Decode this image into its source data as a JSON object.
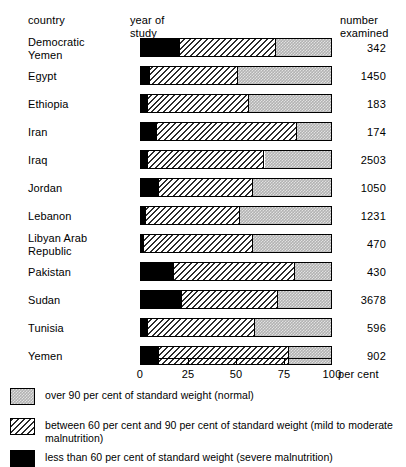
{
  "header": {
    "country_label": "country",
    "year_label": "year of\nstudy",
    "number_label": "number\nexamined"
  },
  "chart_data": {
    "type": "bar",
    "subtype": "stacked-horizontal-100",
    "title": "",
    "xlabel": "per cent",
    "ylabel": "country",
    "xlim": [
      0,
      100
    ],
    "xticks": [
      0,
      25,
      50,
      75,
      100
    ],
    "xtick_labels": [
      "0",
      "25",
      "50",
      "75",
      "100"
    ],
    "axis_unit": "per cent",
    "grid": false,
    "legend_position": "bottom-left",
    "categories": [
      "Democratic Yemen",
      "Egypt",
      "Ethiopia",
      "Iran",
      "Iraq",
      "Jordan",
      "Lebanon",
      "Libyan Arab Republic",
      "Pakistan",
      "Sudan",
      "Tunisia",
      "Yemen"
    ],
    "series": [
      {
        "name": "less than 60 per cent of standard weight (severe malnutrition)",
        "key": "severe",
        "values": [
          20,
          4,
          3,
          8,
          3,
          9,
          2,
          1,
          17,
          21,
          3,
          9
        ]
      },
      {
        "name": "between 60 per cent and 90 per cent of standard weight (mild to moderate malnutrition)",
        "key": "mild",
        "values": [
          51,
          47,
          54,
          74,
          62,
          50,
          50,
          58,
          64,
          51,
          57,
          69
        ]
      },
      {
        "name": "over 90 per cent of standard weight (normal)",
        "key": "normal",
        "values": [
          29,
          49,
          43,
          18,
          35,
          41,
          48,
          41,
          19,
          28,
          40,
          22
        ]
      }
    ],
    "rows": [
      {
        "country": "Democratic\nYemen",
        "year": "1971",
        "number": "342",
        "severe": 20,
        "mild": 51,
        "normal": 29
      },
      {
        "country": "Egypt",
        "year": "1965–66",
        "number": "1450",
        "severe": 4,
        "mild": 47,
        "normal": 49
      },
      {
        "country": "Ethiopia",
        "year": "1970",
        "number": "183",
        "severe": 3,
        "mild": 54,
        "normal": 43
      },
      {
        "country": "Iran",
        "year": "1965–66",
        "number": "174",
        "severe": 8,
        "mild": 74,
        "normal": 18
      },
      {
        "country": "Iraq",
        "year": "1965",
        "number": "2503",
        "severe": 3,
        "mild": 62,
        "normal": 35
      },
      {
        "country": "Jordan",
        "year": "1963–65",
        "number": "1050",
        "severe": 9,
        "mild": 50,
        "normal": 41
      },
      {
        "country": "Lebanon",
        "year": "1969",
        "number": "1231",
        "severe": 2,
        "mild": 50,
        "normal": 48
      },
      {
        "country": "Libyan Arab\nRepublic",
        "year": "1971",
        "number": "470",
        "severe": 1,
        "mild": 58,
        "normal": 41
      },
      {
        "country": "Pakistan",
        "year": "1965–66",
        "number": "430",
        "severe": 17,
        "mild": 64,
        "normal": 19
      },
      {
        "country": "Sudan",
        "year": "1971–72",
        "number": "3678",
        "severe": 21,
        "mild": 51,
        "normal": 28
      },
      {
        "country": "Tunisia",
        "year": "1969–70",
        "number": "596",
        "severe": 3,
        "mild": 57,
        "normal": 40
      },
      {
        "country": "Yemen",
        "year": "1972",
        "number": "902",
        "severe": 9,
        "mild": 69,
        "normal": 22
      }
    ]
  },
  "legend": {
    "items": [
      {
        "swatch": "normal",
        "text": "over 90 per cent of standard weight (normal)"
      },
      {
        "swatch": "mild",
        "text": "between 60 per cent and 90 per cent of standard weight (mild to moderate malnutrition)"
      },
      {
        "swatch": "severe",
        "text": "less than 60 per cent of standard weight (severe malnutrition)"
      }
    ]
  },
  "colors": {
    "normal_fill": "#b2b2b2",
    "mild_fill": "#ffffff",
    "severe_fill": "#000000",
    "outline": "#000000",
    "background": "#ffffff"
  }
}
